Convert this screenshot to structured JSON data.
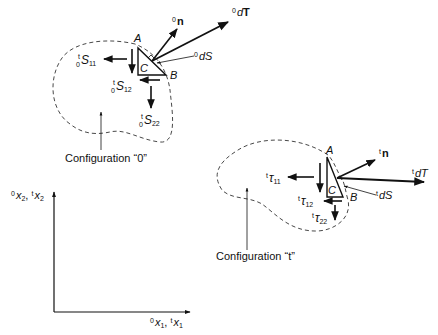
{
  "figure": {
    "config0": {
      "label": "Configuration “0”",
      "points": {
        "A": "A",
        "B": "B",
        "C": "C"
      },
      "normal_label": {
        "sup": "0",
        "main": "n"
      },
      "traction_label": {
        "sup": "0",
        "main": "d",
        "bold": "T"
      },
      "area_label": {
        "sup": "0",
        "main": "dS"
      },
      "stress": [
        {
          "id": "S11",
          "pre_sup": "t",
          "pre_sub": "0",
          "main": "S",
          "sub": "11"
        },
        {
          "id": "S12",
          "pre_sup": "t",
          "pre_sub": "0",
          "main": "S",
          "sub": "12"
        },
        {
          "id": "S22",
          "pre_sup": "t",
          "pre_sub": "0",
          "main": "S",
          "sub": "22"
        }
      ]
    },
    "configt": {
      "label": "Configuration “t”",
      "points": {
        "A": "A",
        "B": "B",
        "C": "C"
      },
      "normal_label": {
        "sup": "t",
        "main": "n"
      },
      "traction_label": {
        "sup": "t",
        "main": "dT"
      },
      "area_label": {
        "sup": "t",
        "main": "dS"
      },
      "stress": [
        {
          "id": "tau11",
          "pre_sup": "t",
          "main": "τ",
          "sub": "11"
        },
        {
          "id": "tau12",
          "pre_sup": "t",
          "main": "τ",
          "sub": "12"
        },
        {
          "id": "tau22",
          "pre_sup": "t",
          "main": "τ",
          "sub": "22"
        }
      ]
    },
    "axes": {
      "x_label": {
        "a_sup": "0",
        "a": "x",
        "a_sub": "1",
        "sep": ", ",
        "b_sup": "t",
        "b": "x",
        "b_sub": "1"
      },
      "y_label": {
        "a_sup": "0",
        "a": "x",
        "a_sub": "2",
        "sep": ", ",
        "b_sup": "t",
        "b": "x",
        "b_sub": "2"
      }
    }
  }
}
